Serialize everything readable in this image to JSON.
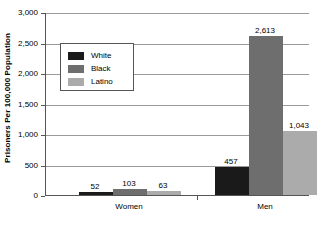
{
  "chart_data": {
    "type": "bar",
    "title": "",
    "subtitle": "",
    "xlabel": "",
    "ylabel": "Prisoners Per 100,000 Population",
    "ylim": [
      0,
      3000
    ],
    "ytick_labels": [
      "0",
      "500",
      "1,000",
      "1,500",
      "2,000",
      "2,500",
      "3,000"
    ],
    "ytick_values": [
      0,
      500,
      1000,
      1500,
      2000,
      2500,
      3000
    ],
    "grid": true,
    "legend_position": "upper-left-inside",
    "categories": [
      "Women",
      "Men"
    ],
    "series": [
      {
        "name": "White",
        "color": "#1a1a1a",
        "values": [
          52,
          457
        ],
        "value_labels": [
          "52",
          "457"
        ]
      },
      {
        "name": "Black",
        "color": "#6e6e6e",
        "values": [
          103,
          2613
        ],
        "value_labels": [
          "103",
          "2,613"
        ]
      },
      {
        "name": "Latino",
        "color": "#ababab",
        "values": [
          63,
          1043
        ],
        "value_labels": [
          "63",
          "1,043"
        ]
      }
    ]
  },
  "colors": {
    "white_series": "#1a1a1a",
    "black_series": "#6e6e6e",
    "latino_series": "#ababab",
    "gridline": "#9a9a9a",
    "axis": "#555555",
    "background": "#ffffff",
    "text": "#000000"
  }
}
